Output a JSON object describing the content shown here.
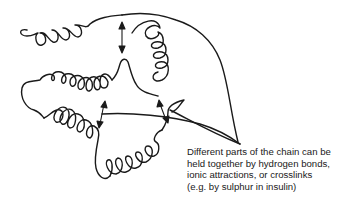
{
  "figure": {
    "stroke_color": "#1a1a1a",
    "background": "#ffffff"
  },
  "caption": {
    "lines": [
      "Different parts of the chain can be",
      "held together by hydrogen bonds,",
      "ionic attractions, or crosslinks",
      "(e.g. by sulphur in insulin)"
    ]
  },
  "annotations": {
    "double_arrows": 4,
    "pointer_lines": 3
  }
}
